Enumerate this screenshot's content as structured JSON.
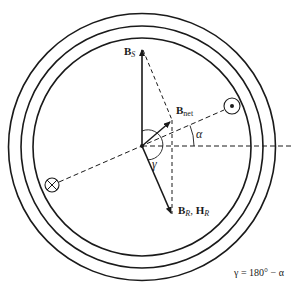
{
  "diagram": {
    "labels": {
      "bs": {
        "main": "B",
        "sub": "S"
      },
      "bnet": {
        "main": "B",
        "sub": "net"
      },
      "br": {
        "main1": "B",
        "sub1": "R",
        "sep": ", ",
        "main2": "H",
        "sub2": "R"
      },
      "alpha": "α",
      "gamma": "γ",
      "formula": "γ = 180° − α"
    },
    "symbols": {
      "dot": "current-out-of-page",
      "cross": "current-into-page"
    },
    "colors": {
      "line": "#1a1a1a",
      "background": "#ffffff"
    }
  }
}
